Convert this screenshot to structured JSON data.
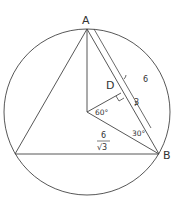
{
  "diagram": {
    "type": "geometry",
    "points": {
      "A": {
        "label": "A"
      },
      "B": {
        "label": "B"
      },
      "D": {
        "label": "D"
      }
    },
    "labels": {
      "side_length": "6",
      "half_side": "3",
      "angle_center": "60°",
      "angle_B": "30°",
      "radius_num": "6",
      "radius_den": "√3"
    },
    "colors": {
      "stroke": "#444444",
      "text": "#333333",
      "background": "#ffffff"
    }
  }
}
